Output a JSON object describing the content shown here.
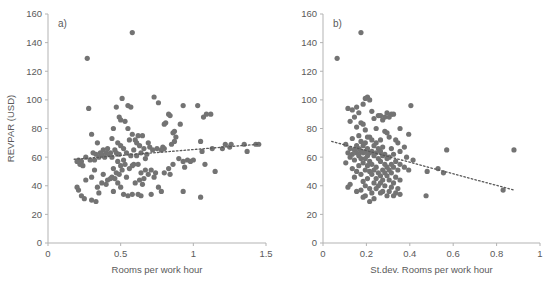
{
  "figure": {
    "background": "#ffffff",
    "marker_color": "#737373",
    "axis_color": "#b3b3b3",
    "text_color": "#5a5a5a",
    "trendline_color": "#595959"
  },
  "panels": [
    {
      "tag": "a)",
      "xlabel": "Rooms per work hour",
      "ylabel": "REVPAR (USD)",
      "xticks": [
        "0",
        "0.5",
        "1",
        "1.5"
      ],
      "yticks": [
        "0",
        "20",
        "40",
        "60",
        "80",
        "100",
        "120",
        "140",
        "160"
      ]
    },
    {
      "tag": "b)",
      "xlabel": "St.dev. Rooms per work hour",
      "ylabel": "",
      "xticks": [
        "0",
        "0.2",
        "0.4",
        "0.6",
        "0.8",
        "1"
      ],
      "yticks": [
        "0",
        "20",
        "40",
        "60",
        "80",
        "100",
        "120",
        "140",
        "160"
      ]
    }
  ],
  "chart_data": [
    {
      "type": "scatter",
      "title": "a)",
      "xlabel": "Rooms per work hour",
      "ylabel": "REVPAR (USD)",
      "xlim": [
        0,
        1.5
      ],
      "ylim": [
        0,
        160
      ],
      "xticks": [
        0,
        0.5,
        1,
        1.5
      ],
      "yticks": [
        0,
        20,
        40,
        60,
        80,
        100,
        120,
        140,
        160
      ],
      "grid": false,
      "legend": null,
      "marker_color": "#737373",
      "trendline": {
        "style": "dotted",
        "color": "#595959",
        "x": [
          0.18,
          1.45
        ],
        "y": [
          58.5,
          69.0
        ]
      },
      "points": [
        [
          0.58,
          147
        ],
        [
          0.27,
          129
        ],
        [
          0.73,
          102
        ],
        [
          0.51,
          101
        ],
        [
          0.76,
          98
        ],
        [
          0.55,
          96
        ],
        [
          0.93,
          96
        ],
        [
          1.03,
          96
        ],
        [
          0.47,
          95
        ],
        [
          0.57,
          95
        ],
        [
          0.28,
          94
        ],
        [
          0.83,
          90
        ],
        [
          1.09,
          90
        ],
        [
          1.12,
          90
        ],
        [
          0.84,
          89
        ],
        [
          1.07,
          88
        ],
        [
          0.49,
          88
        ],
        [
          0.5,
          86
        ],
        [
          0.53,
          85
        ],
        [
          0.81,
          84
        ],
        [
          0.8,
          83
        ],
        [
          0.91,
          83
        ],
        [
          0.45,
          80
        ],
        [
          0.55,
          80
        ],
        [
          0.87,
          78
        ],
        [
          0.86,
          77
        ],
        [
          0.3,
          76
        ],
        [
          0.58,
          76
        ],
        [
          0.62,
          75
        ],
        [
          0.65,
          75
        ],
        [
          0.88,
          74
        ],
        [
          0.44,
          73
        ],
        [
          0.56,
          72
        ],
        [
          0.6,
          72
        ],
        [
          0.87,
          71
        ],
        [
          1.05,
          71
        ],
        [
          0.34,
          70
        ],
        [
          0.48,
          70
        ],
        [
          0.61,
          70
        ],
        [
          0.69,
          70
        ],
        [
          0.85,
          69
        ],
        [
          1.22,
          69
        ],
        [
          1.26,
          69
        ],
        [
          1.35,
          69
        ],
        [
          1.43,
          69
        ],
        [
          1.45,
          69
        ],
        [
          0.5,
          68
        ],
        [
          0.63,
          68
        ],
        [
          0.7,
          67
        ],
        [
          0.79,
          67
        ],
        [
          0.41,
          66
        ],
        [
          0.52,
          66
        ],
        [
          0.66,
          66
        ],
        [
          0.75,
          66
        ],
        [
          0.8,
          66
        ],
        [
          1.13,
          66
        ],
        [
          1.2,
          66
        ],
        [
          1.25,
          67
        ],
        [
          0.38,
          65
        ],
        [
          0.46,
          65
        ],
        [
          0.59,
          65
        ],
        [
          0.72,
          65
        ],
        [
          0.78,
          65
        ],
        [
          1.06,
          64
        ],
        [
          1.37,
          64
        ],
        [
          0.31,
          63
        ],
        [
          0.36,
          63
        ],
        [
          0.4,
          63
        ],
        [
          0.43,
          63
        ],
        [
          0.47,
          63
        ],
        [
          0.54,
          63
        ],
        [
          0.64,
          63
        ],
        [
          0.68,
          62
        ],
        [
          0.33,
          62
        ],
        [
          0.37,
          62
        ],
        [
          0.42,
          62
        ],
        [
          0.49,
          62
        ],
        [
          0.57,
          61
        ],
        [
          0.61,
          61
        ],
        [
          0.26,
          60
        ],
        [
          0.35,
          60
        ],
        [
          0.39,
          60
        ],
        [
          0.44,
          60
        ],
        [
          0.67,
          59
        ],
        [
          0.9,
          59
        ],
        [
          0.21,
          58
        ],
        [
          0.29,
          58
        ],
        [
          0.32,
          58
        ],
        [
          0.52,
          58
        ],
        [
          0.96,
          58
        ],
        [
          1.0,
          58
        ],
        [
          0.2,
          57
        ],
        [
          0.23,
          57
        ],
        [
          0.48,
          57
        ],
        [
          0.93,
          57
        ],
        [
          0.98,
          57
        ],
        [
          0.22,
          55
        ],
        [
          0.53,
          55
        ],
        [
          0.59,
          55
        ],
        [
          0.62,
          55
        ],
        [
          0.86,
          55
        ],
        [
          1.08,
          55
        ],
        [
          0.24,
          54
        ],
        [
          0.5,
          54
        ],
        [
          0.58,
          54
        ],
        [
          0.94,
          53
        ],
        [
          0.45,
          52
        ],
        [
          0.56,
          52
        ],
        [
          0.83,
          52
        ],
        [
          0.32,
          51
        ],
        [
          0.51,
          51
        ],
        [
          0.67,
          51
        ],
        [
          0.71,
          51
        ],
        [
          1.15,
          50
        ],
        [
          0.47,
          49
        ],
        [
          0.64,
          49
        ],
        [
          0.74,
          49
        ],
        [
          0.8,
          49
        ],
        [
          0.38,
          48
        ],
        [
          0.49,
          48
        ],
        [
          0.69,
          48
        ],
        [
          0.84,
          48
        ],
        [
          0.3,
          46
        ],
        [
          0.44,
          46
        ],
        [
          0.54,
          46
        ],
        [
          0.73,
          46
        ],
        [
          0.43,
          45
        ],
        [
          0.46,
          45
        ],
        [
          0.66,
          45
        ],
        [
          0.26,
          44
        ],
        [
          0.41,
          44
        ],
        [
          0.63,
          44
        ],
        [
          0.37,
          42
        ],
        [
          0.48,
          42
        ],
        [
          0.6,
          42
        ],
        [
          0.4,
          41
        ],
        [
          0.65,
          41
        ],
        [
          0.2,
          39
        ],
        [
          0.34,
          39
        ],
        [
          0.5,
          39
        ],
        [
          0.76,
          39
        ],
        [
          0.21,
          37
        ],
        [
          0.45,
          36
        ],
        [
          0.78,
          36
        ],
        [
          0.93,
          36
        ],
        [
          0.35,
          35
        ],
        [
          0.52,
          34
        ],
        [
          0.58,
          34
        ],
        [
          0.62,
          34
        ],
        [
          0.71,
          34
        ],
        [
          0.23,
          33
        ],
        [
          0.55,
          33
        ],
        [
          0.64,
          33
        ],
        [
          1.05,
          32
        ],
        [
          0.25,
          31
        ],
        [
          0.3,
          30
        ],
        [
          0.33,
          29
        ]
      ]
    },
    {
      "type": "scatter",
      "title": "b)",
      "xlabel": "St.dev. Rooms per work hour",
      "ylabel": "REVPAR (USD)",
      "xlim": [
        0,
        1.0
      ],
      "ylim": [
        0,
        160
      ],
      "xticks": [
        0,
        0.2,
        0.4,
        0.6,
        0.8,
        1
      ],
      "yticks": [
        0,
        20,
        40,
        60,
        80,
        100,
        120,
        140,
        160
      ],
      "grid": false,
      "legend": null,
      "marker_color": "#737373",
      "trendline": {
        "style": "dotted",
        "color": "#595959",
        "x": [
          0.04,
          0.88
        ],
        "y": [
          71.0,
          37.0
        ]
      },
      "points": [
        [
          0.175,
          147
        ],
        [
          0.065,
          129
        ],
        [
          0.205,
          102
        ],
        [
          0.195,
          101
        ],
        [
          0.215,
          100
        ],
        [
          0.185,
          97
        ],
        [
          0.405,
          96
        ],
        [
          0.155,
          95
        ],
        [
          0.115,
          94
        ],
        [
          0.135,
          93
        ],
        [
          0.225,
          92
        ],
        [
          0.165,
          91
        ],
        [
          0.295,
          91
        ],
        [
          0.315,
          90
        ],
        [
          0.325,
          90
        ],
        [
          0.255,
          89
        ],
        [
          0.265,
          89
        ],
        [
          0.145,
          88
        ],
        [
          0.285,
          88
        ],
        [
          0.305,
          88
        ],
        [
          0.235,
          87
        ],
        [
          0.275,
          86
        ],
        [
          0.125,
          85
        ],
        [
          0.175,
          84
        ],
        [
          0.185,
          83
        ],
        [
          0.155,
          81
        ],
        [
          0.245,
          80
        ],
        [
          0.355,
          80
        ],
        [
          0.195,
          79
        ],
        [
          0.285,
          78
        ],
        [
          0.295,
          77
        ],
        [
          0.395,
          76
        ],
        [
          0.165,
          75
        ],
        [
          0.205,
          74
        ],
        [
          0.215,
          74
        ],
        [
          0.305,
          74
        ],
        [
          0.135,
          73
        ],
        [
          0.225,
          72
        ],
        [
          0.265,
          72
        ],
        [
          0.335,
          72
        ],
        [
          0.175,
          71
        ],
        [
          0.195,
          70
        ],
        [
          0.245,
          70
        ],
        [
          0.345,
          70
        ],
        [
          0.105,
          69
        ],
        [
          0.155,
          68
        ],
        [
          0.185,
          68
        ],
        [
          0.235,
          68
        ],
        [
          0.275,
          67
        ],
        [
          0.375,
          67
        ],
        [
          0.125,
          66
        ],
        [
          0.165,
          66
        ],
        [
          0.205,
          66
        ],
        [
          0.255,
          66
        ],
        [
          0.315,
          66
        ],
        [
          0.57,
          65
        ],
        [
          0.88,
          65
        ],
        [
          0.145,
          65
        ],
        [
          0.175,
          64
        ],
        [
          0.195,
          64
        ],
        [
          0.225,
          64
        ],
        [
          0.265,
          64
        ],
        [
          0.355,
          64
        ],
        [
          0.115,
          63
        ],
        [
          0.155,
          63
        ],
        [
          0.185,
          63
        ],
        [
          0.215,
          63
        ],
        [
          0.245,
          63
        ],
        [
          0.285,
          62
        ],
        [
          0.325,
          62
        ],
        [
          0.135,
          62
        ],
        [
          0.165,
          61
        ],
        [
          0.205,
          61
        ],
        [
          0.235,
          61
        ],
        [
          0.275,
          61
        ],
        [
          0.305,
          60
        ],
        [
          0.385,
          60
        ],
        [
          0.125,
          60
        ],
        [
          0.175,
          59
        ],
        [
          0.195,
          59
        ],
        [
          0.255,
          59
        ],
        [
          0.295,
          59
        ],
        [
          0.415,
          58
        ],
        [
          0.145,
          58
        ],
        [
          0.215,
          57
        ],
        [
          0.265,
          57
        ],
        [
          0.335,
          57
        ],
        [
          0.105,
          56
        ],
        [
          0.185,
          56
        ],
        [
          0.225,
          55
        ],
        [
          0.285,
          55
        ],
        [
          0.315,
          55
        ],
        [
          0.355,
          55
        ],
        [
          0.165,
          54
        ],
        [
          0.205,
          54
        ],
        [
          0.245,
          53
        ],
        [
          0.295,
          53
        ],
        [
          0.325,
          53
        ],
        [
          0.375,
          53
        ],
        [
          0.53,
          52
        ],
        [
          0.135,
          52
        ],
        [
          0.195,
          51
        ],
        [
          0.235,
          51
        ],
        [
          0.275,
          51
        ],
        [
          0.305,
          51
        ],
        [
          0.345,
          51
        ],
        [
          0.395,
          51
        ],
        [
          0.48,
          50
        ],
        [
          0.155,
          50
        ],
        [
          0.215,
          50
        ],
        [
          0.255,
          49
        ],
        [
          0.285,
          49
        ],
        [
          0.315,
          49
        ],
        [
          0.555,
          49
        ],
        [
          0.175,
          48
        ],
        [
          0.225,
          48
        ],
        [
          0.265,
          47
        ],
        [
          0.295,
          47
        ],
        [
          0.335,
          46
        ],
        [
          0.145,
          46
        ],
        [
          0.205,
          45
        ],
        [
          0.245,
          45
        ],
        [
          0.275,
          44
        ],
        [
          0.305,
          44
        ],
        [
          0.355,
          44
        ],
        [
          0.185,
          43
        ],
        [
          0.235,
          42
        ],
        [
          0.265,
          42
        ],
        [
          0.325,
          42
        ],
        [
          0.125,
          41
        ],
        [
          0.195,
          40
        ],
        [
          0.255,
          40
        ],
        [
          0.285,
          40
        ],
        [
          0.315,
          39
        ],
        [
          0.115,
          39
        ],
        [
          0.215,
          38
        ],
        [
          0.245,
          38
        ],
        [
          0.345,
          38
        ],
        [
          0.83,
          37
        ],
        [
          0.175,
          37
        ],
        [
          0.275,
          36
        ],
        [
          0.305,
          36
        ],
        [
          0.155,
          36
        ],
        [
          0.225,
          35
        ],
        [
          0.265,
          35
        ],
        [
          0.335,
          35
        ],
        [
          0.355,
          34
        ],
        [
          0.475,
          33
        ],
        [
          0.195,
          33
        ],
        [
          0.295,
          33
        ],
        [
          0.325,
          33
        ],
        [
          0.185,
          32
        ],
        [
          0.235,
          31
        ],
        [
          0.215,
          29
        ]
      ]
    }
  ]
}
